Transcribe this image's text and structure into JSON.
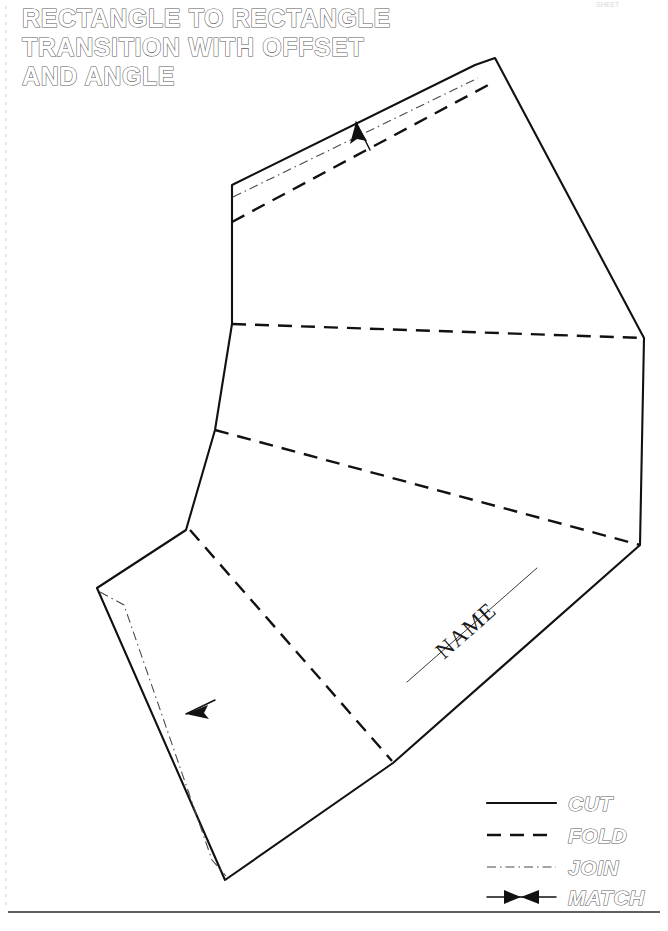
{
  "document": {
    "title_lines": [
      "RECTANGLE TO RECTANGLE",
      "TRANSITION WITH OFFSET",
      "AND ANGLE"
    ],
    "corner_note": "SHEET",
    "name_label": "NAME"
  },
  "legend": {
    "items": [
      {
        "label": "CUT",
        "style": "solid",
        "icon": "solid-line-icon"
      },
      {
        "label": "FOLD",
        "style": "dashed",
        "icon": "dashed-line-icon"
      },
      {
        "label": "JOIN",
        "style": "dash-dot",
        "icon": "dash-dot-line-icon"
      },
      {
        "label": "MATCH",
        "style": "bowtie",
        "icon": "bowtie-marker-icon"
      }
    ]
  },
  "colors": {
    "ink": "#111111",
    "outline_stroke": "#5a5a5a",
    "paper": "#ffffff",
    "join_gray": "#4a4a4a"
  },
  "geometry": {
    "cut_outline": "M 232,185 L 475,65 L 495,58 L 644,338 L 640,545 L 393,763 L 225,880 L 97,588 L 186,530 L 215,430 L 232,324 L 232,222 Z",
    "tab_top_cut": "M 232,185 L 475,65 L 495,58",
    "tab_top_join": "M 233,197 L 478,78",
    "tab_top_fold": "M 232,222 L 490,84",
    "fold_mid_upper": "M 232,324 L 644,338",
    "fold_mid_lower": "M 215,430 L 640,545",
    "fold_diagonal": "M 190,530 L 392,761",
    "tab_left_join": "M 100,592 L 124,605 L 212,860 L 226,876",
    "name_line": "M 407,682 L 537,568",
    "bottom_border": "M 8,912 L 660,912",
    "left_margin": "M 6,6 L 6,905"
  },
  "match_marks": [
    {
      "name": "match-arrow-upper",
      "leader": "M 370,150 L 356,122",
      "tip_x": 356,
      "tip_y": 122,
      "angle": -117
    },
    {
      "name": "match-arrow-lower",
      "leader": "M 215,700 L 186,714",
      "tip_x": 186,
      "tip_y": 714,
      "angle": 206
    }
  ],
  "legend_layout": {
    "x_line_start": 487,
    "x_line_end": 556,
    "x_text": 568,
    "rows_y": [
      809,
      841,
      873,
      903
    ]
  }
}
